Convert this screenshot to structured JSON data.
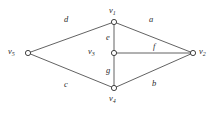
{
  "figure": {
    "type": "undirected-graph-diagram",
    "background_color": "#ffffff",
    "line_color": "#3a3a3a",
    "text_color": "#2b2b2b"
  },
  "vertices": [
    {
      "id": "v1",
      "name": "v",
      "subscript": "1",
      "x": 114,
      "y": 22,
      "label_x": 109,
      "label_y": 6
    },
    {
      "id": "v2",
      "name": "v",
      "subscript": "2",
      "x": 193,
      "y": 53,
      "label_x": 199,
      "label_y": 47
    },
    {
      "id": "v3",
      "name": "v",
      "subscript": "3",
      "x": 114,
      "y": 53,
      "label_x": 88,
      "label_y": 47
    },
    {
      "id": "v4",
      "name": "v",
      "subscript": "4",
      "x": 114,
      "y": 88,
      "label_x": 109,
      "label_y": 94
    },
    {
      "id": "v5",
      "name": "v",
      "subscript": "5",
      "x": 28,
      "y": 53,
      "label_x": 8,
      "label_y": 47
    }
  ],
  "edges": [
    {
      "id": "d",
      "label": "d",
      "from": "v5",
      "to": "v1",
      "label_x": 64,
      "label_y": 15
    },
    {
      "id": "a",
      "label": "a",
      "from": "v1",
      "to": "v2",
      "label_x": 149,
      "label_y": 15
    },
    {
      "id": "c",
      "label": "c",
      "from": "v5",
      "to": "v4",
      "label_x": 64,
      "label_y": 80
    },
    {
      "id": "b",
      "label": "b",
      "from": "v4",
      "to": "v2",
      "label_x": 152,
      "label_y": 79
    },
    {
      "id": "e",
      "label": "e",
      "from": "v1",
      "to": "v3",
      "label_x": 106,
      "label_y": 33
    },
    {
      "id": "g",
      "label": "g",
      "from": "v3",
      "to": "v4",
      "label_x": 106,
      "label_y": 66
    },
    {
      "id": "f",
      "label": "f",
      "from": "v3",
      "to": "v2",
      "label_x": 153,
      "label_y": 42
    }
  ]
}
